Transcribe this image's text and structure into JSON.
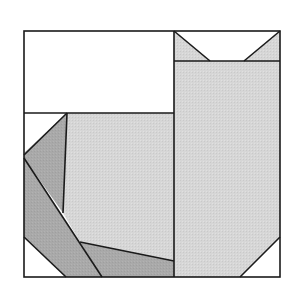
{
  "diagram": {
    "title": "",
    "type": "quilt-block-cat",
    "canvas": {
      "width": 301,
      "height": 294,
      "background": "#ffffff"
    },
    "colors": {
      "white": "#ffffff",
      "light_gray": "#d6d6d6",
      "dark_gray": "#a9a9a9",
      "outline": "#1a1a1a"
    },
    "frame": {
      "x": 24,
      "y": 31,
      "width": 256,
      "height": 246
    },
    "pieces": [
      {
        "name": "background-top-left",
        "fill": "white",
        "points": "24,31 174,31 174,113 24,113"
      },
      {
        "name": "ear-left",
        "fill": "light_gray",
        "points": "174,31 210,61 174,61"
      },
      {
        "name": "ear-gap",
        "fill": "white",
        "points": "174,31 280,31 244,61 210,61"
      },
      {
        "name": "ear-right",
        "fill": "light_gray",
        "points": "280,31 280,61 244,61"
      },
      {
        "name": "cat-head-body",
        "fill": "light_gray",
        "points": "174,61 280,61 280,237 240,277 174,277"
      },
      {
        "name": "corner-bottom-right",
        "fill": "white",
        "points": "280,237 280,277 240,277"
      },
      {
        "name": "background-left-corner",
        "fill": "white",
        "points": "24,113 67,113 24,153"
      },
      {
        "name": "tail-upper",
        "fill": "dark_gray",
        "points": "67,113 24,153 24,158 63,213"
      },
      {
        "name": "cat-back",
        "fill": "light_gray",
        "points": "67,113 174,113 174,261 80,242 63,213"
      },
      {
        "name": "tail-lower",
        "fill": "dark_gray",
        "points": "24,158 102,277 66,277 24,237"
      },
      {
        "name": "corner-bottom-left",
        "fill": "white",
        "points": "24,237 66,277 24,277"
      },
      {
        "name": "cat-belly",
        "fill": "dark_gray",
        "points": "80,242 174,261 174,277 102,277"
      }
    ],
    "lines": [
      {
        "name": "divider-vertical",
        "x1": 174,
        "y1": 31,
        "x2": 174,
        "y2": 277
      },
      {
        "name": "divider-left-horizontal",
        "x1": 24,
        "y1": 113,
        "x2": 174,
        "y2": 113
      },
      {
        "name": "ear-band-line",
        "x1": 174,
        "y1": 61,
        "x2": 280,
        "y2": 61
      },
      {
        "name": "ear-left-edge",
        "x1": 174,
        "y1": 31,
        "x2": 210,
        "y2": 61
      },
      {
        "name": "ear-right-edge",
        "x1": 280,
        "y1": 31,
        "x2": 244,
        "y2": 61
      },
      {
        "name": "tail-top-edge",
        "x1": 67,
        "y1": 113,
        "x2": 24,
        "y2": 155
      },
      {
        "name": "tail-inner-edge",
        "x1": 67,
        "y1": 113,
        "x2": 63,
        "y2": 213
      },
      {
        "name": "tail-diagonal",
        "x1": 24,
        "y1": 158,
        "x2": 102,
        "y2": 277
      },
      {
        "name": "belly-edge",
        "x1": 80,
        "y1": 242,
        "x2": 174,
        "y2": 261
      },
      {
        "name": "corner-bottom-left-edge",
        "x1": 24,
        "y1": 237,
        "x2": 66,
        "y2": 277
      },
      {
        "name": "corner-bottom-right-edge",
        "x1": 280,
        "y1": 237,
        "x2": 240,
        "y2": 277
      }
    ]
  }
}
